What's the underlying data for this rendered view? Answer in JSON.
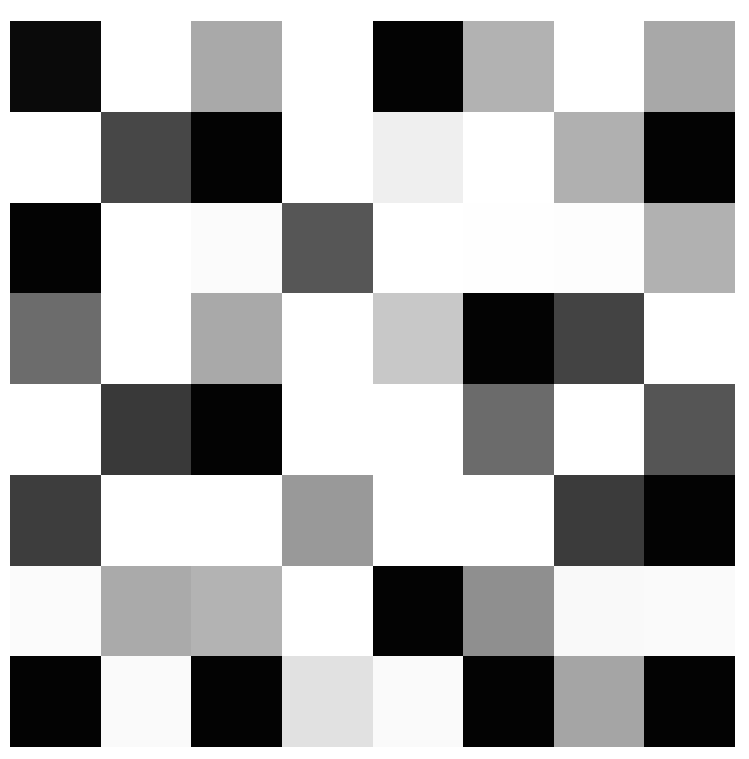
{
  "grid": {
    "rows": 8,
    "cols": 8,
    "cells": [
      [
        "#0a0a0a",
        "#ffffff",
        "#a9a9a9",
        "#ffffff",
        "#030303",
        "#b2b2b2",
        "#ffffff",
        "#a8a8a8"
      ],
      [
        "#ffffff",
        "#474747",
        "#030303",
        "#ffffff",
        "#efefef",
        "#ffffff",
        "#b0b0b0",
        "#030303"
      ],
      [
        "#030303",
        "#ffffff",
        "#fbfbfb",
        "#565656",
        "#ffffff",
        "#fefefe",
        "#fdfdfd",
        "#b1b1b1"
      ],
      [
        "#6c6c6c",
        "#ffffff",
        "#a9a9a9",
        "#ffffff",
        "#c8c8c8",
        "#030303",
        "#434343",
        "#ffffff"
      ],
      [
        "#ffffff",
        "#393939",
        "#030303",
        "#ffffff",
        "#ffffff",
        "#6b6b6b",
        "#ffffff",
        "#555555"
      ],
      [
        "#3d3d3d",
        "#ffffff",
        "#ffffff",
        "#999999",
        "#ffffff",
        "#ffffff",
        "#3b3b3b",
        "#030303"
      ],
      [
        "#fbfbfb",
        "#aaaaaa",
        "#b3b3b3",
        "#ffffff",
        "#030303",
        "#8f8f8f",
        "#f9f9f9",
        "#fafafa"
      ],
      [
        "#030303",
        "#fafafa",
        "#030303",
        "#e1e1e1",
        "#fafafa",
        "#030303",
        "#a5a5a5",
        "#030303"
      ]
    ]
  }
}
